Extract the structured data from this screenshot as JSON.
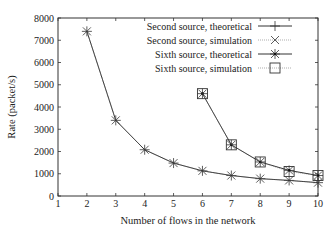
{
  "chart_data": {
    "type": "line",
    "title": "",
    "xlabel": "Number of flows in the network",
    "ylabel": "Rate (packet/s)",
    "xlim": [
      1,
      10
    ],
    "ylim": [
      0,
      8000
    ],
    "xticks": [
      1,
      2,
      3,
      4,
      5,
      6,
      7,
      8,
      9,
      10
    ],
    "yticks": [
      0,
      1000,
      2000,
      3000,
      4000,
      5000,
      6000,
      7000,
      8000
    ],
    "grid": false,
    "legend_position": "upper right",
    "series": [
      {
        "name": "Second source, theoretical",
        "marker": "plus",
        "line": "solid",
        "x": [
          2,
          3,
          4,
          5,
          6,
          7,
          8,
          9,
          10
        ],
        "values": [
          7400,
          3400,
          2080,
          1480,
          1130,
          920,
          780,
          700,
          600
        ]
      },
      {
        "name": "Second source, simulation",
        "marker": "cross",
        "line": "dotted",
        "x": [
          2,
          3,
          4,
          5,
          6,
          7,
          8,
          9,
          10
        ],
        "values": [
          7400,
          3400,
          2080,
          1480,
          1130,
          920,
          780,
          700,
          600
        ]
      },
      {
        "name": "Sixth source, theoretical",
        "marker": "star",
        "line": "solid",
        "x": [
          6,
          7,
          8,
          9,
          10
        ],
        "values": [
          4600,
          2300,
          1530,
          1150,
          920
        ]
      },
      {
        "name": "Sixth source, simulation",
        "marker": "square",
        "line": "dotted",
        "x": [
          6,
          7,
          8,
          9,
          10
        ],
        "values": [
          4600,
          2300,
          1530,
          1100,
          920
        ]
      }
    ]
  }
}
